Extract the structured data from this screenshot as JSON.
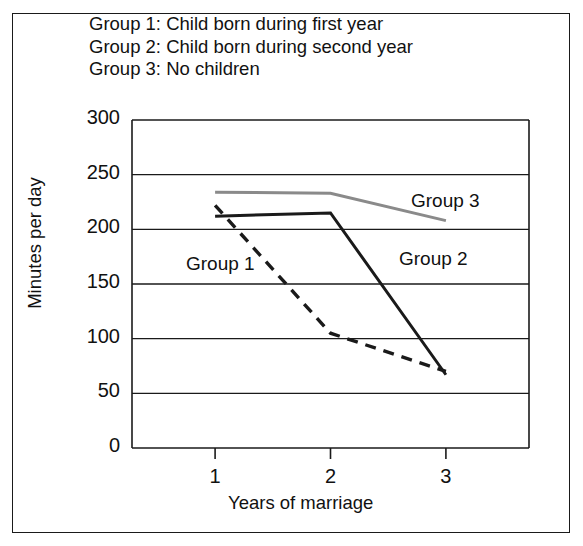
{
  "figure": {
    "legend_lines": [
      "Group 1: Child born during first year",
      "Group 2: Child born during second year",
      "Group 3: No children"
    ],
    "colors": {
      "group1": "#1a1a1a",
      "group2": "#1a1a1a",
      "group3": "#8a8a8a",
      "axis": "#1a1a1a",
      "grid": "#1a1a1a",
      "frame": "#1a1a1a",
      "background": "#ffffff"
    },
    "inline_labels": [
      {
        "text": "Group 1",
        "x": 186,
        "y": 253
      },
      {
        "text": "Group 2",
        "x": 399,
        "y": 248
      },
      {
        "text": "Group 3",
        "x": 411,
        "y": 190
      }
    ]
  },
  "chart_data": {
    "type": "line",
    "title": "",
    "xlabel": "Years of marriage",
    "ylabel": "Minutes per day",
    "categories": [
      "1",
      "2",
      "3"
    ],
    "x": [
      1,
      2,
      3
    ],
    "xlim": [
      0.28,
      3.72
    ],
    "ylim": [
      0,
      300
    ],
    "ytick_labels": [
      "0",
      "50",
      "100",
      "150",
      "200",
      "250",
      "300"
    ],
    "yticks": [
      0,
      50,
      100,
      150,
      200,
      250,
      300
    ],
    "xtick_labels": [
      "1",
      "2",
      "3"
    ],
    "grid": "horizontal",
    "legend_position": "above-plot",
    "series": [
      {
        "name": "Group 1",
        "description": "Child born during first year",
        "style": "dashed",
        "color": "#1a1a1a",
        "values": [
          222,
          105,
          70
        ]
      },
      {
        "name": "Group 2",
        "description": "Child born during second year",
        "style": "solid",
        "color": "#1a1a1a",
        "values": [
          212,
          215,
          67
        ]
      },
      {
        "name": "Group 3",
        "description": "No children",
        "style": "solid",
        "color": "#8a8a8a",
        "values": [
          234,
          233,
          208
        ]
      }
    ]
  }
}
